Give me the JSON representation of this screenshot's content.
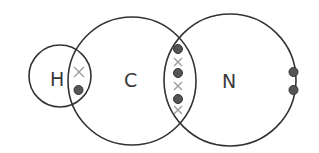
{
  "diagram": {
    "colors": {
      "outline": "#333333",
      "dot": "#555555",
      "cross": "#9a9a9a",
      "label": "#3a3a3a",
      "background": "#ffffff"
    },
    "atoms": [
      {
        "symbol": "H",
        "cx": 60,
        "cy": 76,
        "r": 31
      },
      {
        "symbol": "C",
        "cx": 132,
        "cy": 81,
        "r": 64
      },
      {
        "symbol": "N",
        "cx": 230,
        "cy": 80,
        "r": 66
      }
    ],
    "bonds": [
      {
        "between": [
          "H",
          "C"
        ],
        "type": "single",
        "dots": 1,
        "crosses": 1
      },
      {
        "between": [
          "C",
          "N"
        ],
        "type": "triple",
        "dots": 3,
        "crosses": 3
      }
    ],
    "lone_pairs": [
      {
        "atom": "N",
        "electrons": 2,
        "symbol": "dot"
      }
    ],
    "legend": {
      "dot": "electron from N / H",
      "cross": "electron from C"
    }
  }
}
